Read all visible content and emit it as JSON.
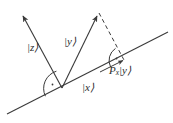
{
  "figure": {
    "kind": "vector-projection-diagram",
    "background_color": "#ffffff",
    "stroke_color": "#3a3a3a",
    "label_color": "#2b2b2b",
    "width": 173,
    "height": 123,
    "labels": {
      "z_ket": "|z⟩",
      "y_ket": "|y⟩",
      "x_ket": "|x⟩",
      "projection": "P",
      "projection_subscript": "x",
      "projection_ket": "|y⟩"
    },
    "geometry": {
      "origin": {
        "x": 62,
        "y": 88
      },
      "subspace_line": {
        "x1": 7,
        "y1": 114,
        "x2": 168,
        "y2": 32
      },
      "z_vector": {
        "x1": 62,
        "y1": 88,
        "x2": 21,
        "y2": 12
      },
      "y_vector": {
        "x1": 62,
        "y1": 88,
        "x2": 99,
        "y2": 12
      },
      "dashed_projection": {
        "x1": 99,
        "y1": 12,
        "x2": 124,
        "y2": 60
      },
      "projection_point": {
        "x": 124,
        "y": 60
      },
      "right_angle_origin": {
        "cx": 62,
        "cy": 88,
        "r": 17
      },
      "right_angle_projection": {
        "cx": 124,
        "cy": 60,
        "r": 13
      }
    }
  }
}
